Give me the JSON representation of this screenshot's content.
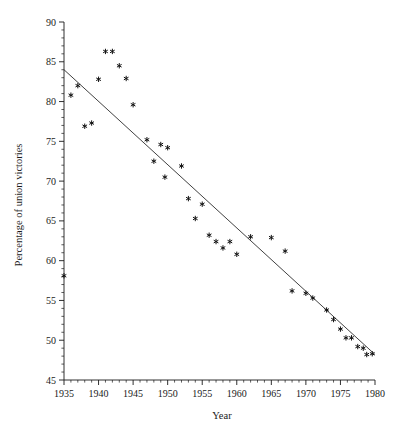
{
  "chart_data": {
    "type": "scatter",
    "title": "",
    "xlabel": "Year",
    "ylabel": "Percentage of union victories",
    "xlim": [
      1935,
      1980
    ],
    "ylim": [
      45,
      90
    ],
    "grid": false,
    "legend": "none",
    "marker": "asterisk",
    "x_ticks": [
      1935,
      1940,
      1945,
      1950,
      1955,
      1960,
      1965,
      1970,
      1975,
      1980
    ],
    "x_tick_labels": [
      "1935",
      "1940",
      "1945",
      "1950",
      "1955",
      "1960",
      "1965",
      "1970",
      "1975",
      "1980"
    ],
    "x_minor_tick_step": 1,
    "y_ticks": [
      45,
      50,
      55,
      60,
      65,
      70,
      75,
      80,
      85,
      90
    ],
    "y_tick_labels": [
      "45",
      "50",
      "55",
      "60",
      "65",
      "70",
      "75",
      "80",
      "85",
      "90"
    ],
    "y_minor_tick_step": 1,
    "x": [
      1935,
      1936,
      1937,
      1938,
      1939,
      1940,
      1941,
      1942,
      1943,
      1944,
      1945,
      1946,
      1947,
      1948,
      1949,
      1950,
      1951,
      1952,
      1953,
      1954,
      1955,
      1956,
      1957,
      1958,
      1959,
      1960,
      1961,
      1962,
      1963,
      1964,
      1965,
      1966,
      1967,
      1968,
      1969,
      1970,
      1971,
      1972,
      1973,
      1974,
      1975,
      1976,
      1977,
      1978,
      1979
    ],
    "y": [
      58.1,
      80.8,
      82.0,
      76.9,
      77.3,
      86.3,
      86.3,
      84.5,
      82.8,
      82.9,
      79.6,
      75.2,
      74.6,
      74.2,
      72.5,
      70.5,
      71.9,
      67.8,
      65.3,
      63.2,
      62.4,
      61.6,
      65.5,
      62.1,
      58.9,
      61.1,
      56.2,
      55.9,
      55.3,
      53.8,
      53.1,
      52.3,
      51.6,
      51.4,
      50.2,
      49.6,
      49.4,
      48.7,
      48.6,
      48.2,
      49.8,
      49.4,
      48.6,
      48.1,
      48.4
    ],
    "points": [
      {
        "x": 1935,
        "y": 58.1
      },
      {
        "x": 1936,
        "y": 80.8
      },
      {
        "x": 1937,
        "y": 82.0
      },
      {
        "x": 1938,
        "y": 76.9
      },
      {
        "x": 1939,
        "y": 77.3
      },
      {
        "x": 1941,
        "y": 86.3
      },
      {
        "x": 1942,
        "y": 86.3
      },
      {
        "x": 1943,
        "y": 84.5
      },
      {
        "x": 1940,
        "y": 82.8
      },
      {
        "x": 1944,
        "y": 82.9
      },
      {
        "x": 1945,
        "y": 79.6
      },
      {
        "x": 1947,
        "y": 75.2
      },
      {
        "x": 1949,
        "y": 74.6
      },
      {
        "x": 1950,
        "y": 74.2
      },
      {
        "x": 1948,
        "y": 72.5
      },
      {
        "x": 1949.6,
        "y": 70.5
      },
      {
        "x": 1952,
        "y": 71.9
      },
      {
        "x": 1953,
        "y": 67.8
      },
      {
        "x": 1954,
        "y": 65.3
      },
      {
        "x": 1955,
        "y": 67.1
      },
      {
        "x": 1956,
        "y": 63.2
      },
      {
        "x": 1957,
        "y": 62.4
      },
      {
        "x": 1958,
        "y": 61.6
      },
      {
        "x": 1959,
        "y": 62.4
      },
      {
        "x": 1960,
        "y": 60.8
      },
      {
        "x": 1962,
        "y": 63.0
      },
      {
        "x": 1965,
        "y": 62.9
      },
      {
        "x": 1967,
        "y": 61.2
      },
      {
        "x": 1968,
        "y": 56.2
      },
      {
        "x": 1970,
        "y": 55.9
      },
      {
        "x": 1971,
        "y": 55.3
      },
      {
        "x": 1973,
        "y": 53.8
      },
      {
        "x": 1974,
        "y": 52.6
      },
      {
        "x": 1975,
        "y": 51.4
      },
      {
        "x": 1975.8,
        "y": 50.3
      },
      {
        "x": 1976.6,
        "y": 50.3
      },
      {
        "x": 1977.5,
        "y": 49.2
      },
      {
        "x": 1978.3,
        "y": 49.0
      },
      {
        "x": 1978.8,
        "y": 48.2
      },
      {
        "x": 1979.6,
        "y": 48.3
      }
    ],
    "fit_line": {
      "label": "least-squares fit",
      "x_start": 1935,
      "y_start": 84.0,
      "x_end": 1980,
      "y_end": 48.2
    }
  }
}
